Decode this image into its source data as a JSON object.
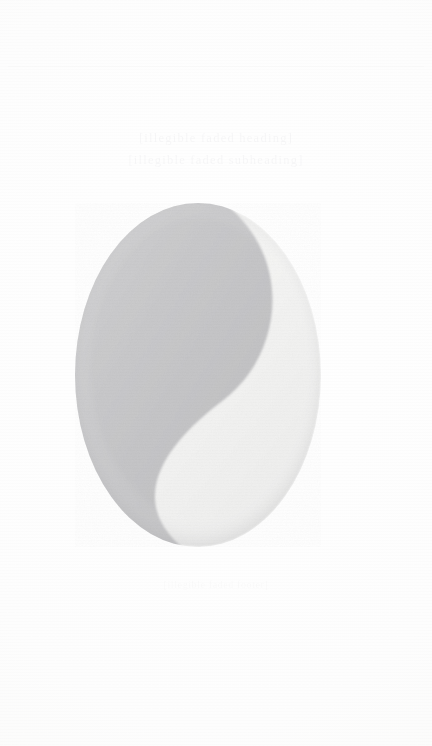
{
  "page": {
    "kind": "scanned-page",
    "width": 432,
    "height": 746,
    "background_color": "#fefefe",
    "paper_tint": "#fbfbfa"
  },
  "ghost_text": {
    "heading": {
      "lines": [
        "[illegible faded heading]",
        "[illegible faded subheading]"
      ]
    },
    "body_upper": {
      "lines": [
        "[illegible faded text]",
        "[illegible faded text]",
        "[illegible faded text]"
      ]
    },
    "body_lower": {
      "lines": [
        "[illegible faded text]",
        "[illegible faded text]"
      ]
    },
    "caption": {
      "lines": [
        "[illegible faded caption]"
      ]
    },
    "footer": {
      "lines": [
        "[illegible faded footer]"
      ]
    }
  },
  "mark": {
    "name": "yin-yang-circle-mark",
    "shape": "circle-split-by-s-curve",
    "bounds": {
      "x": 75,
      "y": 203,
      "width": 246,
      "height": 344
    },
    "circle": {
      "cx": 198,
      "cy": 375,
      "r": 123
    },
    "dark_lobe_color": "#c8c8c9",
    "dark_lobe_color_edge": "#bcbcbe",
    "light_lobe_color": "#f3f3f2",
    "light_lobe_color_edge": "#e9e9e8",
    "rim_color": "#d4d4d5",
    "orientation": "dark lobe upper-left, light lobe lower-right"
  }
}
